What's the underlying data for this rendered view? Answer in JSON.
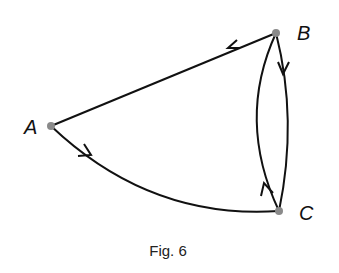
{
  "figure": {
    "caption": "Fig. 6",
    "nodes": [
      {
        "id": "A",
        "label": "A"
      },
      {
        "id": "B",
        "label": "B"
      },
      {
        "id": "C",
        "label": "C"
      }
    ],
    "edges": [
      {
        "from": "B",
        "to": "A",
        "shape": "straight"
      },
      {
        "from": "A",
        "to": "C",
        "shape": "curved"
      },
      {
        "from": "B",
        "to": "C",
        "shape": "curved-right"
      },
      {
        "from": "C",
        "to": "B",
        "shape": "curved-left"
      }
    ],
    "colors": {
      "line": "#111111",
      "node": "#8a8a8a"
    }
  }
}
